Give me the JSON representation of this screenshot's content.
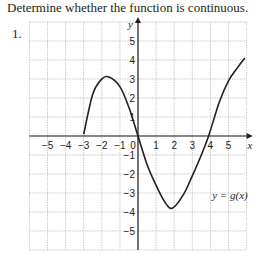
{
  "prompt": "Determine whether the function is continuous.",
  "problem_number": "1.",
  "chart_data": {
    "type": "line",
    "title": "",
    "xlabel": "x",
    "ylabel": "y",
    "xlim": [
      -6,
      6
    ],
    "ylim": [
      -6,
      6
    ],
    "grid": true,
    "x_ticks": [
      -5,
      -4,
      -3,
      -2,
      -1,
      0,
      1,
      2,
      3,
      4,
      5
    ],
    "y_ticks": [
      5,
      4,
      3,
      2,
      1,
      -1,
      -2,
      -3,
      -4,
      -5
    ],
    "x_tick_labels": [
      "−5",
      "−4",
      "−3",
      "−2",
      "−1",
      "0",
      "1",
      "2",
      "3",
      "4",
      "5"
    ],
    "y_tick_labels": [
      "5",
      "4",
      "3",
      "2",
      "1",
      "−1",
      "−2",
      "−3",
      "−4",
      "−5"
    ],
    "annotation": "y = g(x)",
    "series": [
      {
        "name": "y = g(x)",
        "points": [
          [
            -3,
            0.1
          ],
          [
            -2.5,
            2.2
          ],
          [
            -2,
            3.0
          ],
          [
            -1.6,
            3.1
          ],
          [
            -1,
            2.6
          ],
          [
            -0.5,
            1.5
          ],
          [
            0,
            0
          ],
          [
            0.5,
            -1.5
          ],
          [
            1,
            -2.6
          ],
          [
            1.5,
            -3.5
          ],
          [
            1.9,
            -3.8
          ],
          [
            2.5,
            -3.1
          ],
          [
            3,
            -2.1
          ],
          [
            3.5,
            -1.0
          ],
          [
            3.9,
            0
          ],
          [
            4.5,
            1.8
          ],
          [
            5,
            2.9
          ],
          [
            5.5,
            3.6
          ],
          [
            5.9,
            4.1
          ]
        ]
      }
    ]
  }
}
